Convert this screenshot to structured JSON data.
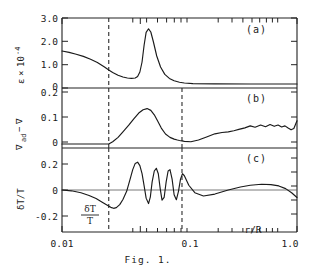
{
  "figure": {
    "caption": "Fig. 1.",
    "x_axis": {
      "label": "r/R",
      "scale": "log",
      "min": 0.01,
      "max": 1.0,
      "tick_labels": [
        "0.01",
        "0.1",
        "1.0"
      ],
      "tick_values": [
        0.01,
        0.1,
        1.0
      ]
    },
    "markers": {
      "dashed_lines": [
        0.025,
        0.105
      ],
      "dashed_label": "convective boundary"
    }
  },
  "chart_data": [
    {
      "type": "line",
      "panel": "a",
      "panel_label": "(a)",
      "title": "",
      "xlabel": "r/R",
      "ylabel": "ε×10⁻⁴",
      "ylabel_parts": {
        "symbol": "ε",
        "times": "×",
        "base": "10",
        "exponent": "-4"
      },
      "xscale": "log",
      "xlim": [
        0.01,
        1.0
      ],
      "ylim": [
        0,
        3.1
      ],
      "ytick_labels": [
        "0",
        "1.0",
        "2.0",
        "3.0"
      ],
      "ytick_values": [
        0,
        1.0,
        2.0,
        3.0
      ],
      "grid": false,
      "x": [
        0.01,
        0.0115,
        0.0132,
        0.0152,
        0.0175,
        0.02,
        0.023,
        0.025,
        0.027,
        0.03,
        0.033,
        0.036,
        0.039,
        0.042,
        0.044,
        0.046,
        0.048,
        0.05,
        0.052,
        0.0545,
        0.057,
        0.06,
        0.064,
        0.069,
        0.075,
        0.082,
        0.09,
        0.1,
        0.11,
        0.13,
        0.2,
        0.4,
        1.0
      ],
      "y": [
        1.65,
        1.58,
        1.49,
        1.38,
        1.24,
        1.08,
        0.85,
        0.7,
        0.58,
        0.44,
        0.35,
        0.3,
        0.28,
        0.3,
        0.38,
        0.6,
        1.1,
        1.95,
        2.58,
        2.76,
        2.6,
        2.1,
        1.4,
        0.85,
        0.48,
        0.28,
        0.16,
        0.09,
        0.05,
        0.02,
        0.005,
        0.001,
        0.0
      ]
    },
    {
      "type": "line",
      "panel": "b",
      "panel_label": "(b)",
      "title": "",
      "xlabel": "r/R",
      "ylabel": "∇ad−∇",
      "ylabel_parts": {
        "nabla": "∇",
        "sub": "ad",
        "minus": "−",
        "nabla2": "∇"
      },
      "xscale": "log",
      "xlim": [
        0.01,
        1.0
      ],
      "ylim": [
        0,
        0.235
      ],
      "ytick_labels": [
        "0",
        "0.1",
        "0.2"
      ],
      "ytick_values": [
        0,
        0.1,
        0.2
      ],
      "grid": false,
      "x": [
        0.01,
        0.015,
        0.02,
        0.025,
        0.027,
        0.03,
        0.033,
        0.037,
        0.041,
        0.045,
        0.049,
        0.053,
        0.057,
        0.061,
        0.065,
        0.07,
        0.076,
        0.083,
        0.09,
        0.096,
        0.1,
        0.105,
        0.11,
        0.125,
        0.145,
        0.17,
        0.2,
        0.23,
        0.26,
        0.29,
        0.32,
        0.36,
        0.4,
        0.44,
        0.49,
        0.54,
        0.59,
        0.64,
        0.69,
        0.74,
        0.79,
        0.84,
        0.89,
        0.94,
        1.0
      ],
      "y": [
        0.0,
        0.0,
        0.0,
        0.0,
        0.01,
        0.03,
        0.055,
        0.085,
        0.115,
        0.14,
        0.155,
        0.16,
        0.152,
        0.132,
        0.105,
        0.072,
        0.045,
        0.03,
        0.022,
        0.018,
        0.016,
        0.014,
        0.012,
        0.01,
        0.018,
        0.032,
        0.046,
        0.052,
        0.055,
        0.06,
        0.066,
        0.073,
        0.082,
        0.076,
        0.086,
        0.078,
        0.088,
        0.08,
        0.086,
        0.077,
        0.082,
        0.072,
        0.064,
        0.07,
        0.105
      ]
    },
    {
      "type": "line",
      "panel": "c",
      "panel_label": "(c)",
      "title": "",
      "xlabel": "r/R",
      "ylabel": "δT/T",
      "inline_annotation": {
        "numerator": "δT",
        "denominator": "T"
      },
      "xscale": "log",
      "xlim": [
        0.01,
        1.0
      ],
      "ylim": [
        -0.28,
        0.28
      ],
      "ytick_labels": [
        "-0.2",
        "0",
        "0.2"
      ],
      "ytick_values": [
        -0.2,
        0,
        0.2
      ],
      "grid": false,
      "x": [
        0.01,
        0.012,
        0.0145,
        0.017,
        0.0195,
        0.022,
        0.0245,
        0.026,
        0.0275,
        0.029,
        0.031,
        0.033,
        0.0355,
        0.038,
        0.04,
        0.042,
        0.044,
        0.046,
        0.048,
        0.05,
        0.052,
        0.0545,
        0.0565,
        0.0585,
        0.061,
        0.0635,
        0.066,
        0.0685,
        0.071,
        0.074,
        0.077,
        0.08,
        0.083,
        0.0865,
        0.09,
        0.094,
        0.098,
        0.102,
        0.106,
        0.11,
        0.12,
        0.135,
        0.16,
        0.2,
        0.26,
        0.33,
        0.4,
        0.5,
        0.6,
        0.7,
        0.8,
        0.9,
        1.0
      ],
      "y": [
        0.0,
        -0.006,
        -0.02,
        -0.04,
        -0.063,
        -0.09,
        -0.115,
        -0.128,
        -0.135,
        -0.13,
        -0.108,
        -0.07,
        -0.01,
        0.08,
        0.15,
        0.196,
        0.205,
        0.18,
        0.12,
        0.03,
        -0.06,
        -0.1,
        -0.05,
        0.06,
        0.14,
        0.16,
        0.12,
        0.01,
        -0.075,
        -0.055,
        0.06,
        0.14,
        0.15,
        0.08,
        -0.035,
        -0.072,
        -0.01,
        0.08,
        0.12,
        0.105,
        0.035,
        -0.02,
        -0.044,
        -0.03,
        0.0,
        0.022,
        0.035,
        0.042,
        0.04,
        0.03,
        0.01,
        -0.02,
        -0.055
      ]
    }
  ]
}
